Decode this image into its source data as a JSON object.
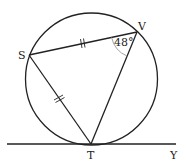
{
  "diagram": {
    "type": "circle-geometry",
    "circle": {
      "cx": 91.5,
      "cy": 79,
      "r": 66
    },
    "points": {
      "S": {
        "label": "S",
        "x": 29,
        "y": 55
      },
      "V": {
        "label": "V",
        "x": 137,
        "y": 32
      },
      "T": {
        "label": "T",
        "x": 91,
        "y": 144
      },
      "Y": {
        "label": "Y",
        "x": 174,
        "y": 144
      }
    },
    "segments": [
      "SV",
      "ST",
      "VT"
    ],
    "tangent_line": {
      "from_x": 7,
      "to_x": 176,
      "y": 144,
      "through": "T",
      "end_label": "Y"
    },
    "equal_marks": {
      "segments": [
        "SV",
        "ST"
      ],
      "style": "double-tick"
    },
    "angle": {
      "vertex": "V",
      "label": "48°",
      "value_degrees": 48
    },
    "colors": {
      "stroke": "#222222",
      "angle_arc": "#999999",
      "background": "#ffffff"
    }
  }
}
